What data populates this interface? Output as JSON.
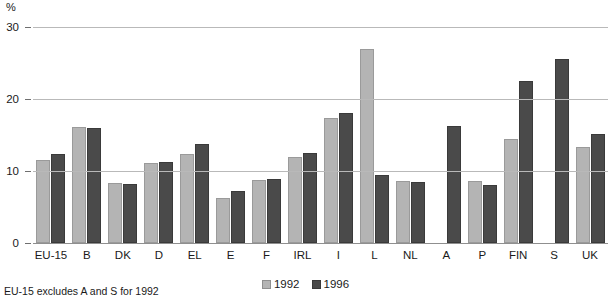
{
  "chart_data": {
    "type": "bar",
    "title": "",
    "subtitle": "",
    "xlabel": "",
    "ylabel": "%",
    "ylim": [
      0,
      30
    ],
    "yticks": [
      0,
      10,
      20,
      30
    ],
    "grid": true,
    "legend_position": "bottom-center",
    "categories": [
      "EU-15",
      "B",
      "DK",
      "D",
      "EL",
      "E",
      "F",
      "IRL",
      "I",
      "L",
      "NL",
      "A",
      "P",
      "FIN",
      "S",
      "UK"
    ],
    "series": [
      {
        "name": "1992",
        "color": "#b4b4b4",
        "values": [
          11.5,
          16.1,
          8.4,
          11.1,
          12.4,
          6.3,
          8.7,
          12.0,
          17.4,
          27.0,
          8.6,
          null,
          8.6,
          14.5,
          null,
          13.4
        ]
      },
      {
        "name": "1996",
        "color": "#4a4a4a",
        "values": [
          12.4,
          16.0,
          8.2,
          11.3,
          13.8,
          7.2,
          8.9,
          12.5,
          18.0,
          9.5,
          8.5,
          16.3,
          8.1,
          22.5,
          25.5,
          15.1
        ]
      }
    ],
    "annotations": [
      "EU-15 excludes A and S for 1992"
    ]
  },
  "axis": {
    "unit_label": "%",
    "tick_labels": [
      "30",
      "20",
      "10",
      "0"
    ]
  },
  "legend": {
    "items": [
      {
        "label": "1992",
        "swatch": "light-gray-swatch"
      },
      {
        "label": "1996",
        "swatch": "dark-gray-swatch"
      }
    ]
  },
  "footnote": {
    "text": "EU-15 excludes A and S for 1992"
  },
  "colors": {
    "series_1992": "#b4b4b4",
    "series_1996": "#4a4a4a",
    "gridline": "#b9b9b9",
    "baseline": "#8f8f8f",
    "background": "#ffffff",
    "text": "#1a1a1a"
  }
}
